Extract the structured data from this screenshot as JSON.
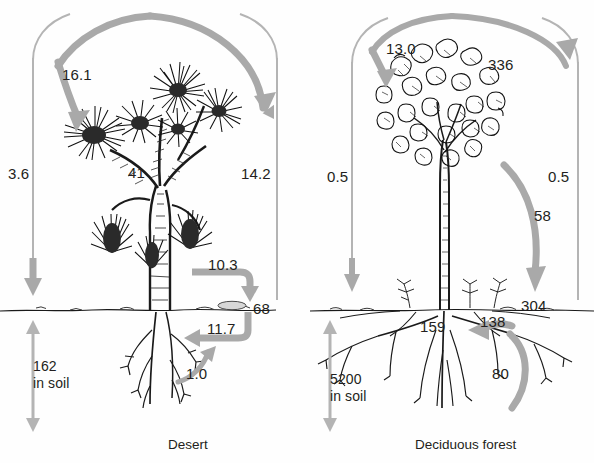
{
  "figure": {
    "title": "",
    "background_color": "#fefefe",
    "arrow_color": "#a9a9a9",
    "thin_line_color": "#b4b4b4",
    "text_color": "#231f20",
    "ink_color": "#1a1a1a"
  },
  "panels": [
    {
      "id": "desert",
      "caption": "Desert",
      "caption_x": 168,
      "caption_y": 437,
      "plant_icon": "joshua-tree-drawing",
      "labels": [
        {
          "name": "precipitation-input",
          "text": "16.1",
          "x": 62,
          "y": 66,
          "role": "flux-to-canopy"
        },
        {
          "name": "left-column-flux",
          "text": "3.6",
          "x": 8,
          "y": 165,
          "role": "flux-down-left"
        },
        {
          "name": "canopy-pool",
          "text": "41",
          "x": 128,
          "y": 164,
          "role": "pool-aboveground"
        },
        {
          "name": "right-column-flux",
          "text": "14.2",
          "x": 241,
          "y": 165,
          "role": "flux-up-right"
        },
        {
          "name": "litterfall-flux",
          "text": "10.3",
          "x": 208,
          "y": 256,
          "role": "flux-to-soil"
        },
        {
          "name": "surface-pool",
          "text": "68",
          "x": 253,
          "y": 306,
          "role": "pool-surface"
        },
        {
          "name": "uptake-flux",
          "text": "11.7",
          "x": 207,
          "y": 320,
          "role": "flux-from-soil"
        },
        {
          "name": "root-flux",
          "text": "1.0",
          "x": 186,
          "y": 368,
          "role": "flux-root"
        }
      ],
      "soil_label": {
        "name": "soil-pool-desert",
        "value": "162",
        "unit_text": "in soil",
        "x": 33,
        "y": 358
      }
    },
    {
      "id": "deciduous-forest",
      "caption": "Deciduous forest",
      "caption_x": 415,
      "caption_y": 437,
      "plant_icon": "deciduous-tree-drawing",
      "labels": [
        {
          "name": "precipitation-input",
          "text": "13.0",
          "x": 386,
          "y": 40,
          "role": "flux-to-canopy"
        },
        {
          "name": "canopy-pool",
          "text": "336",
          "x": 488,
          "y": 56,
          "role": "pool-aboveground"
        },
        {
          "name": "left-column-flux",
          "text": "0.5",
          "x": 327,
          "y": 168,
          "role": "flux-down-left"
        },
        {
          "name": "right-column-flux",
          "text": "0.5",
          "x": 548,
          "y": 168,
          "role": "flux-up-right"
        },
        {
          "name": "litterfall-flux",
          "text": "58",
          "x": 534,
          "y": 207,
          "role": "flux-to-soil"
        },
        {
          "name": "surface-pool",
          "text": "304",
          "x": 521,
          "y": 303,
          "role": "pool-surface"
        },
        {
          "name": "root-pool",
          "text": "159",
          "x": 420,
          "y": 320,
          "role": "pool-root"
        },
        {
          "name": "soil-surface-pool",
          "text": "138",
          "x": 480,
          "y": 319,
          "role": "pool-soil-surface"
        },
        {
          "name": "uptake-flux",
          "text": "80",
          "x": 492,
          "y": 369,
          "role": "flux-from-soil"
        }
      ],
      "soil_label": {
        "name": "soil-pool-forest",
        "value": "5200",
        "unit_text": "in soil",
        "x": 330,
        "y": 371
      }
    }
  ]
}
